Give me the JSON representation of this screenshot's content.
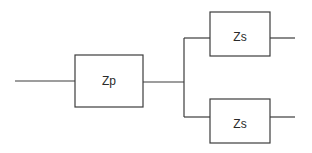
{
  "diagram": {
    "type": "impedance-network",
    "blocks": [
      {
        "id": "zp",
        "label": "Zp"
      },
      {
        "id": "zs_top",
        "label": "Zs"
      },
      {
        "id": "zs_bottom",
        "label": "Zs"
      }
    ],
    "connections": [
      {
        "from": "input",
        "to": "zp"
      },
      {
        "from": "zp",
        "to": "junction"
      },
      {
        "from": "junction",
        "to": "zs_top"
      },
      {
        "from": "junction",
        "to": "zs_bottom"
      },
      {
        "from": "zs_top",
        "to": "output_top"
      },
      {
        "from": "zs_bottom",
        "to": "output_bottom"
      }
    ]
  }
}
